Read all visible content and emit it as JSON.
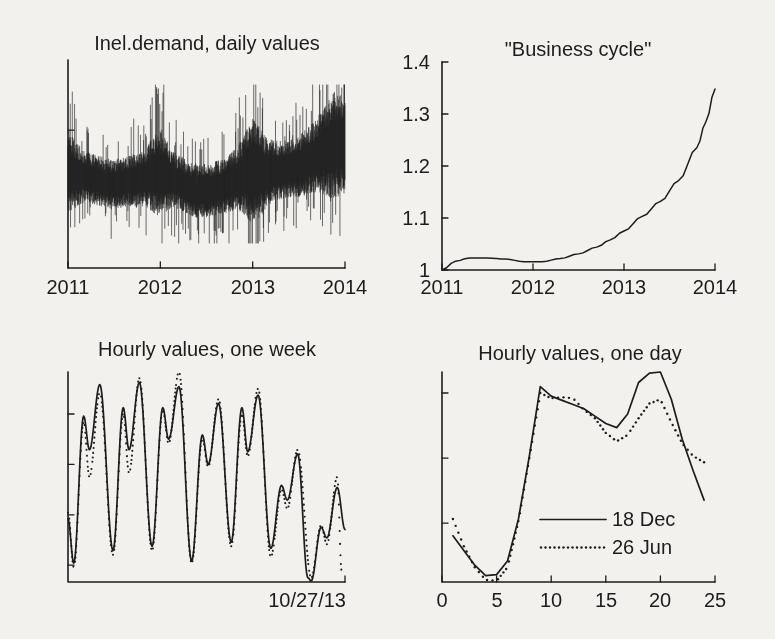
{
  "page": {
    "background": "#f2f1ee",
    "ink": "#1d1d1d"
  },
  "chart_data": [
    {
      "id": "daily-demand",
      "type": "line",
      "title": "Inel.demand, daily values",
      "x_ticks": [
        "2011",
        "2012",
        "2013",
        "2014"
      ],
      "x_range_years": [
        2011,
        2014
      ],
      "y_tick_labels": [],
      "y_tick_positions_norm": [
        0.663
      ],
      "note": "Dense noisy daily series forming a black band; values are normalized 0-1 of plot height, band center and half-width given per month over 36 months.",
      "band_center_monthly": [
        0.47,
        0.45,
        0.44,
        0.43,
        0.42,
        0.41,
        0.4,
        0.41,
        0.42,
        0.42,
        0.43,
        0.45,
        0.46,
        0.44,
        0.42,
        0.4,
        0.38,
        0.37,
        0.37,
        0.38,
        0.39,
        0.41,
        0.43,
        0.45,
        0.47,
        0.46,
        0.46,
        0.47,
        0.47,
        0.48,
        0.49,
        0.51,
        0.53,
        0.56,
        0.58,
        0.6,
        0.58
      ],
      "band_halfwidth_monthly": [
        0.2,
        0.16,
        0.13,
        0.12,
        0.12,
        0.12,
        0.12,
        0.12,
        0.12,
        0.13,
        0.13,
        0.18,
        0.22,
        0.16,
        0.13,
        0.13,
        0.13,
        0.13,
        0.13,
        0.13,
        0.13,
        0.14,
        0.15,
        0.2,
        0.26,
        0.22,
        0.16,
        0.14,
        0.14,
        0.14,
        0.15,
        0.16,
        0.17,
        0.2,
        0.24,
        0.26,
        0.22
      ]
    },
    {
      "id": "business-cycle",
      "type": "line",
      "title": "\"Business cycle\"",
      "x_ticks": [
        "2011",
        "2012",
        "2013",
        "2014"
      ],
      "y_ticks": [
        "1",
        "1.1",
        "1.2",
        "1.3",
        "1.4"
      ],
      "ylim": [
        1,
        1.4
      ],
      "x_range_years": [
        2011,
        2014
      ],
      "points": [
        [
          2011.0,
          1.0
        ],
        [
          2011.15,
          1.017
        ],
        [
          2011.3,
          1.023
        ],
        [
          2011.5,
          1.023
        ],
        [
          2011.7,
          1.021
        ],
        [
          2011.9,
          1.016
        ],
        [
          2012.1,
          1.016
        ],
        [
          2012.3,
          1.022
        ],
        [
          2012.5,
          1.031
        ],
        [
          2012.7,
          1.044
        ],
        [
          2012.85,
          1.058
        ],
        [
          2013.0,
          1.075
        ],
        [
          2013.2,
          1.103
        ],
        [
          2013.4,
          1.132
        ],
        [
          2013.6,
          1.172
        ],
        [
          2013.8,
          1.235
        ],
        [
          2013.9,
          1.285
        ],
        [
          2014.0,
          1.348
        ]
      ]
    },
    {
      "id": "hourly-week",
      "type": "line",
      "title": "Hourly values, one week",
      "x_end_label": "10/27/13",
      "hours_span": 168,
      "y_tick_labels": [],
      "y_tick_positions_norm": [
        0.8,
        0.56,
        0.32,
        0.08
      ],
      "note": "Seven daily double-peak cycles, Mon-Fri high, weekend low; values normalized 0-1 of plot height; points are [hour, value].",
      "series": [
        {
          "name": "solid week curve",
          "style": "solid",
          "points": [
            [
              0,
              0.3
            ],
            [
              3.5,
              0.09
            ],
            [
              9.5,
              0.79
            ],
            [
              13,
              0.63
            ],
            [
              19.3,
              0.94
            ],
            [
              27.3,
              0.15
            ],
            [
              33.5,
              0.83
            ],
            [
              37,
              0.63
            ],
            [
              43.3,
              0.95
            ],
            [
              51,
              0.17
            ],
            [
              57.5,
              0.83
            ],
            [
              61,
              0.68
            ],
            [
              67.3,
              0.93
            ],
            [
              75,
              0.1
            ],
            [
              81.5,
              0.7
            ],
            [
              85,
              0.56
            ],
            [
              91.3,
              0.85
            ],
            [
              99,
              0.19
            ],
            [
              105.5,
              0.83
            ],
            [
              109,
              0.62
            ],
            [
              115.3,
              0.89
            ],
            [
              123,
              0.16
            ],
            [
              129.5,
              0.46
            ],
            [
              133,
              0.39
            ],
            [
              139.3,
              0.61
            ],
            [
              145.5,
              0.02
            ],
            [
              147.5,
              0.005
            ],
            [
              153.5,
              0.26
            ],
            [
              157,
              0.21
            ],
            [
              163.3,
              0.45
            ],
            [
              168,
              0.25
            ]
          ]
        },
        {
          "name": "dotted week curve",
          "style": "dotted",
          "points": [
            [
              0,
              0.33
            ],
            [
              3.5,
              0.07
            ],
            [
              9.5,
              0.76
            ],
            [
              13,
              0.5
            ],
            [
              19.3,
              0.9
            ],
            [
              27.3,
              0.13
            ],
            [
              33.5,
              0.8
            ],
            [
              37,
              0.52
            ],
            [
              43.3,
              0.97
            ],
            [
              51,
              0.15
            ],
            [
              57.5,
              0.82
            ],
            [
              61,
              0.66
            ],
            [
              67.3,
              1.0
            ],
            [
              75,
              0.09
            ],
            [
              81.5,
              0.68
            ],
            [
              85,
              0.55
            ],
            [
              91.3,
              0.87
            ],
            [
              99,
              0.17
            ],
            [
              105.5,
              0.8
            ],
            [
              109,
              0.6
            ],
            [
              115.3,
              0.92
            ],
            [
              123,
              0.12
            ],
            [
              129.5,
              0.44
            ],
            [
              133,
              0.35
            ],
            [
              139.3,
              0.63
            ],
            [
              147.5,
              0.02
            ],
            [
              153.5,
              0.27
            ],
            [
              157,
              0.18
            ],
            [
              163.3,
              0.5
            ],
            [
              166,
              0.05
            ]
          ]
        }
      ]
    },
    {
      "id": "hourly-day",
      "type": "line",
      "title": "Hourly values, one day",
      "x_ticks": [
        "0",
        "5",
        "10",
        "15",
        "20",
        "25"
      ],
      "xlim": [
        0,
        25
      ],
      "y_tick_labels": [],
      "y_tick_positions_norm": [
        0.9,
        0.59,
        0.28
      ],
      "legend_position": "inside-lower-middle",
      "hours": [
        1,
        2,
        3,
        4,
        5,
        6,
        7,
        8,
        9,
        10,
        11,
        12,
        13,
        14,
        15,
        16,
        17,
        18,
        19,
        20,
        21,
        22,
        23,
        24
      ],
      "series": [
        {
          "name": "18 Dec",
          "style": "solid",
          "values": [
            0.22,
            0.15,
            0.08,
            0.03,
            0.035,
            0.1,
            0.3,
            0.6,
            0.93,
            0.885,
            0.865,
            0.845,
            0.825,
            0.79,
            0.755,
            0.735,
            0.8,
            0.95,
            0.995,
            1.0,
            0.87,
            0.68,
            0.53,
            0.39
          ]
        },
        {
          "name": "26 Jun",
          "style": "dotted",
          "values": [
            0.3,
            0.17,
            0.07,
            0.01,
            0.005,
            0.07,
            0.29,
            0.59,
            0.9,
            0.875,
            0.88,
            0.875,
            0.82,
            0.78,
            0.71,
            0.67,
            0.7,
            0.78,
            0.85,
            0.87,
            0.76,
            0.66,
            0.6,
            0.57
          ]
        }
      ]
    }
  ]
}
